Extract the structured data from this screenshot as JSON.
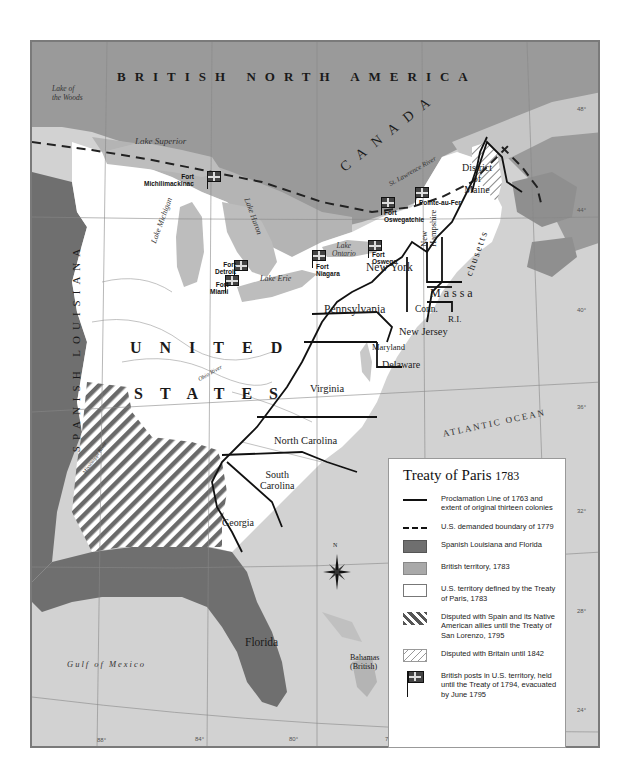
{
  "map": {
    "title": "Treaty of Paris 1783",
    "regions": {
      "british_north_america": "BRITISH NORTH AMERICA",
      "canada": "CANADA",
      "united": "UNITED",
      "states": "STATES",
      "spanish_louisiana": "SPANISH LOUISIANA",
      "florida": "Florida",
      "bahamas": "Bahamas",
      "bahamas_sub": "(British)"
    },
    "states": {
      "district_of_maine_1": "District",
      "district_of_maine_2": "of",
      "district_of_maine_3": "Maine",
      "new_hampshire_1": "New",
      "new_hampshire_2": "Hampshire",
      "massachusetts_1": "Massa",
      "massachusetts_2": "chusetts",
      "new_york": "New York",
      "connecticut": "Conn.",
      "rhode_island": "R.I.",
      "pennsylvania": "Pennsylvania",
      "new_jersey": "New Jersey",
      "maryland": "Maryland",
      "delaware": "Delaware",
      "virginia": "Virginia",
      "north_carolina": "North Carolina",
      "south_carolina_1": "South",
      "south_carolina_2": "Carolina",
      "georgia": "Georgia"
    },
    "water": {
      "lake_of_the_woods_1": "Lake of",
      "lake_of_the_woods_2": "the Woods",
      "lake_superior": "Lake Superior",
      "lake_michigan": "Lake Michigan",
      "lake_huron": "Lake Huron",
      "lake_erie": "Lake Erie",
      "lake_ontario_1": "Lake",
      "lake_ontario_2": "Ontario",
      "st_lawrence": "St. Lawrence River",
      "ohio_river": "Ohio River",
      "mississippi_river": "Mississippi River",
      "atlantic_ocean": "ATLANTIC OCEAN",
      "gulf_of_mexico": "Gulf of Mexico"
    },
    "boundary_note": "Boundary\nnot defined",
    "forts": [
      {
        "name": "Fort\nMichilimackinac"
      },
      {
        "name": "Fort\nDetroit"
      },
      {
        "name": "Fort\nMiami"
      },
      {
        "name": "Fort\nNiagara"
      },
      {
        "name": "Fort\nOswego"
      },
      {
        "name": "Fort\nOswegatchie"
      },
      {
        "name": "Pointe-au-Fer"
      }
    ],
    "compass": "N",
    "longitude_ticks": [
      "88°",
      "84°",
      "80°",
      "76°",
      "72°"
    ],
    "latitude_ticks": [
      "48°",
      "44°",
      "40°",
      "36°",
      "32°",
      "28°",
      "28°",
      "24°"
    ]
  },
  "legend": {
    "title": "Treaty of Paris",
    "title_year": "1783",
    "items": [
      {
        "symbol": "solid-line",
        "label": "Proclamation Line of 1763 and extent of original thirteen colonies"
      },
      {
        "symbol": "dashed-line",
        "label": "U.S. demanded boundary of 1779"
      },
      {
        "symbol": "dark-fill",
        "label": "Spanish Louisiana and Florida",
        "color": "#6f6f6f"
      },
      {
        "symbol": "medium-fill",
        "label": "British territory, 1783",
        "color": "#a9a9a9"
      },
      {
        "symbol": "white-fill",
        "label": "U.S. territory defined by the Treaty of Paris, 1783",
        "color": "#ffffff"
      },
      {
        "symbol": "heavy-hatch",
        "label": "Disputed with Spain and its Native American allies until the Treaty of San Lorenzo, 1795"
      },
      {
        "symbol": "light-hatch",
        "label": "Disputed with Britain until 1842"
      },
      {
        "symbol": "flag",
        "label": "British posts in U.S. territory, held until the Treaty of 1794, evacuated by June 1795"
      }
    ]
  },
  "colors": {
    "spanish": "#6f6f6f",
    "british": "#a9a9a9",
    "canada_dark": "#9a9a9a",
    "us": "#ffffff",
    "water": "#d2d2d2",
    "lakes": "#bdbdbd"
  }
}
